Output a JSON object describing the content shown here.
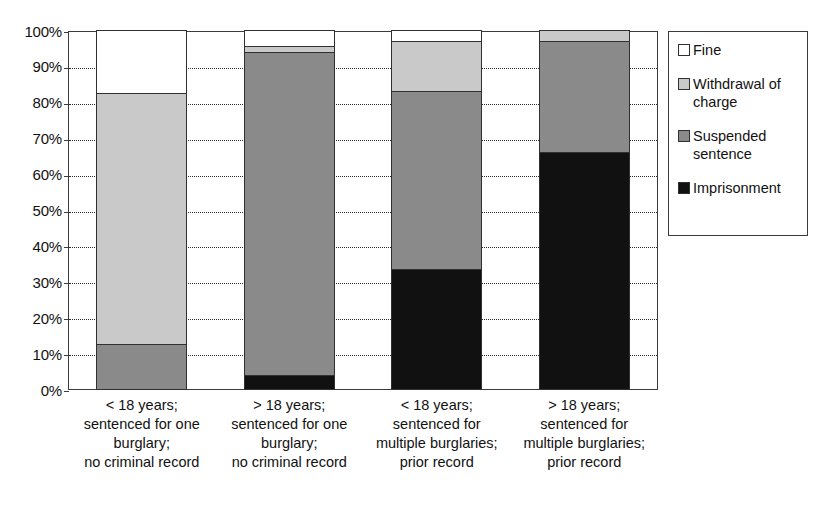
{
  "chart_data": {
    "type": "bar",
    "subtype": "stacked-100-percent",
    "title": "",
    "subtitle": "",
    "xlabel": "",
    "ylabel": "",
    "ylim": [
      0,
      100
    ],
    "yunit": "%",
    "grid": true,
    "legend_position": "right",
    "ytick_labels": [
      "100%",
      "90%",
      "80%",
      "70%",
      "60%",
      "50%",
      "40%",
      "30%",
      "20%",
      "10%",
      "0%"
    ],
    "ytick_values": [
      100,
      90,
      80,
      70,
      60,
      50,
      40,
      30,
      20,
      10,
      0
    ],
    "categories": [
      "< 18 years; sentenced for one burglary; no criminal record",
      "> 18 years; sentenced for one burglary; no criminal record",
      "< 18 years; sentenced for multiple burglaries; prior record",
      "> 18 years; sentenced for multiple burglaries; prior record"
    ],
    "category_lines": [
      [
        "< 18 years;",
        "sentenced for one",
        "burglary;",
        "no criminal record"
      ],
      [
        "> 18 years;",
        "sentenced for one",
        "burglary;",
        "no criminal record"
      ],
      [
        "< 18 years;",
        "sentenced for",
        "multiple burglaries;",
        "prior record"
      ],
      [
        "> 18 years;",
        "sentenced for",
        "multiple burglaries;",
        "prior record"
      ]
    ],
    "series": [
      {
        "name": "Imprisonment",
        "color": "#111111",
        "values": [
          0.0,
          4.0,
          33.5,
          66.0
        ]
      },
      {
        "name": "Suspended sentence",
        "color": "#8a8a8a",
        "values": [
          12.5,
          90.0,
          49.5,
          31.0
        ]
      },
      {
        "name": "Withdrawal of charge",
        "color": "#c9c9c9",
        "values": [
          70.0,
          1.5,
          14.0,
          3.0
        ]
      },
      {
        "name": "Fine",
        "color": "#ffffff",
        "values": [
          17.5,
          4.5,
          3.0,
          0.0
        ]
      }
    ]
  },
  "legend": {
    "items": [
      {
        "label": "Fine",
        "swatch_class": "sw-fine"
      },
      {
        "label": "Withdrawal of charge",
        "swatch_class": "sw-withdrawal"
      },
      {
        "label": "Suspended sentence",
        "swatch_class": "sw-suspended"
      },
      {
        "label": "Imprisonment",
        "swatch_class": "sw-imprisonment"
      }
    ]
  },
  "colors": {
    "fine": "#ffffff",
    "withdrawal_of_charge": "#c9c9c9",
    "suspended_sentence": "#8a8a8a",
    "imprisonment": "#111111",
    "axis": "#3b3b3b",
    "grid": "#2e2e2e"
  }
}
